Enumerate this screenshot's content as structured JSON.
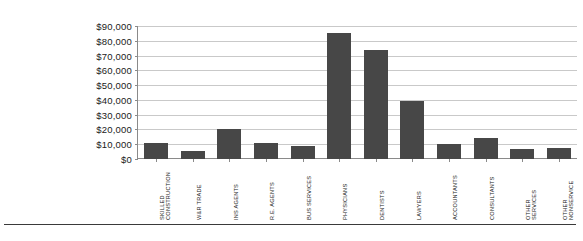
{
  "chart_data": {
    "type": "bar",
    "title": "",
    "subtitle": "",
    "xlabel": "",
    "ylabel": "",
    "ylim": [
      0,
      90000
    ],
    "grid": true,
    "legend": false,
    "legend_position": "none",
    "bar_color": "#474747",
    "gridline_color": "#c9c9c9",
    "axis_color": "#8a8a8a",
    "y_ticks": [
      "$0",
      "$10,000",
      "$20,000",
      "$30,000",
      "$40,000",
      "$50,000",
      "$60,000",
      "$70,000",
      "$80,000",
      "$90,000"
    ],
    "y_tick_values": [
      0,
      10000,
      20000,
      30000,
      40000,
      50000,
      60000,
      70000,
      80000,
      90000
    ],
    "categories": [
      "SKILLED CONSTRUCTION",
      "W&R TRADE",
      "INS AGENTS",
      "R.E. AGENTS",
      "BUS SERVICES",
      "PHYSICIANS",
      "DENTISTS",
      "LAWYERS",
      "ACCOUNTANTS",
      "CONSULTANTS",
      "OTHER SERVICES",
      "OTHER NONSERVICE"
    ],
    "category_labels_multiline": [
      "SKILLED\nCONSTRUCTION",
      "W&R TRADE",
      "INS AGENTS",
      "R.E. AGENTS",
      "BUS SERVICES",
      "PHYSICIANS",
      "DENTISTS",
      "LAWYERS",
      "ACCOUNTANTS",
      "CONSULTANTS",
      "OTHER\nSERVICES",
      "OTHER\nNONSERVICE"
    ],
    "values": [
      10500,
      5500,
      20000,
      11000,
      8500,
      85000,
      73500,
      39500,
      10000,
      14500,
      7000,
      7500
    ]
  }
}
